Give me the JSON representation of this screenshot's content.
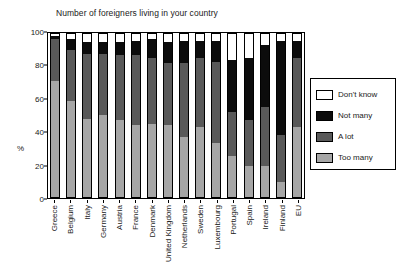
{
  "chart_data": {
    "type": "bar",
    "title": "Number of foreigners living in your country",
    "xlabel": "",
    "ylabel": "%",
    "ylim": [
      0,
      100
    ],
    "yticks": [
      0,
      20,
      40,
      60,
      80,
      100
    ],
    "grid": false,
    "stacked": true,
    "legend_position": "right",
    "categories": [
      "Greece",
      "Belgium",
      "Italy",
      "Germany",
      "Austria",
      "France",
      "Denmark",
      "United Kingdom",
      "Netherlands",
      "Sweden",
      "Luxembourg",
      "Portugal",
      "Spain",
      "Ireland",
      "Finland",
      "EU"
    ],
    "series": [
      {
        "name": "Too many",
        "color": "#a6a6a6",
        "values": [
          71,
          59,
          48,
          50,
          47,
          44,
          45,
          44,
          37,
          43,
          33,
          25,
          19,
          19,
          9,
          43
        ]
      },
      {
        "name": "A lot",
        "color": "#595959",
        "values": [
          26,
          31,
          40,
          38,
          40,
          43,
          40,
          38,
          45,
          42,
          50,
          27,
          28,
          36,
          29,
          42
        ]
      },
      {
        "name": "Not many",
        "color": "#0c0c0c",
        "values": [
          2,
          7,
          7,
          7,
          8,
          9,
          12,
          13,
          14,
          11,
          13,
          32,
          38,
          38,
          58,
          11
        ]
      },
      {
        "name": "Don't know",
        "color": "#ffffff",
        "values": [
          1,
          3,
          5,
          5,
          5,
          4,
          3,
          5,
          4,
          4,
          4,
          16,
          15,
          7,
          4,
          4
        ]
      }
    ],
    "legend": [
      {
        "label": "Don't know",
        "color": "#ffffff"
      },
      {
        "label": "Not many",
        "color": "#0c0c0c"
      },
      {
        "label": "A lot",
        "color": "#595959"
      },
      {
        "label": "Too many",
        "color": "#a6a6a6"
      }
    ]
  }
}
